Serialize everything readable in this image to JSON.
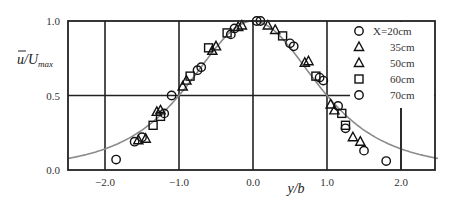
{
  "chart_data": {
    "type": "scatter",
    "title": "",
    "xlabel": "y/b",
    "ylabel": "ū/U_max",
    "xlim": [
      -2.5,
      2.5
    ],
    "ylim": [
      0.0,
      1.0
    ],
    "x_ticks": [
      "-2.0",
      "-1.0",
      "0.0",
      "1.0",
      "2.0"
    ],
    "y_ticks": [
      "0.0",
      "0.5",
      "1.0"
    ],
    "grid": true,
    "legend_position": "upper right",
    "legend": [
      "X=20cm",
      "35cm",
      "50cm",
      "60cm",
      "70cm"
    ],
    "reference_curve": "similarity profile (gray solid line)",
    "series": [
      {
        "name": "X=20cm",
        "marker": "circle",
        "points": [
          [
            -1.85,
            0.07
          ],
          [
            -1.5,
            0.22
          ],
          [
            -1.1,
            0.5
          ],
          [
            -0.75,
            0.67
          ],
          [
            -0.3,
            0.91
          ],
          [
            0.05,
            1.0
          ],
          [
            0.5,
            0.85
          ],
          [
            0.9,
            0.62
          ],
          [
            1.25,
            0.28
          ],
          [
            1.8,
            0.06
          ]
        ]
      },
      {
        "name": "35cm",
        "marker": "triangle",
        "points": [
          [
            -1.55,
            0.2
          ],
          [
            -1.25,
            0.4
          ],
          [
            -0.9,
            0.6
          ],
          [
            -0.5,
            0.83
          ],
          [
            -0.15,
            0.97
          ],
          [
            0.3,
            0.94
          ],
          [
            0.7,
            0.72
          ],
          [
            1.05,
            0.44
          ],
          [
            1.35,
            0.22
          ]
        ]
      },
      {
        "name": "50cm",
        "marker": "triangle",
        "points": [
          [
            -1.45,
            0.21
          ],
          [
            -1.3,
            0.39
          ],
          [
            -0.95,
            0.56
          ],
          [
            -0.55,
            0.8
          ],
          [
            -0.2,
            0.96
          ],
          [
            0.2,
            0.97
          ],
          [
            0.75,
            0.73
          ],
          [
            1.1,
            0.4
          ],
          [
            1.45,
            0.19
          ]
        ]
      },
      {
        "name": "60cm",
        "marker": "square",
        "points": [
          [
            -1.35,
            0.3
          ],
          [
            -1.25,
            0.36
          ],
          [
            -0.85,
            0.63
          ],
          [
            -0.6,
            0.82
          ],
          [
            -0.35,
            0.92
          ],
          [
            0.4,
            0.9
          ],
          [
            0.85,
            0.63
          ],
          [
            1.2,
            0.38
          ],
          [
            1.25,
            0.3
          ]
        ]
      },
      {
        "name": "70cm",
        "marker": "circle",
        "points": [
          [
            -1.6,
            0.19
          ],
          [
            -1.2,
            0.38
          ],
          [
            -0.7,
            0.69
          ],
          [
            -0.25,
            0.95
          ],
          [
            0.1,
            1.0
          ],
          [
            0.55,
            0.83
          ],
          [
            0.95,
            0.6
          ],
          [
            1.15,
            0.43
          ],
          [
            1.5,
            0.13
          ]
        ]
      }
    ]
  },
  "axes": {
    "x_label": "y/b",
    "y_label_main": "u",
    "y_label_rest": "/U",
    "y_label_sub": "max"
  }
}
